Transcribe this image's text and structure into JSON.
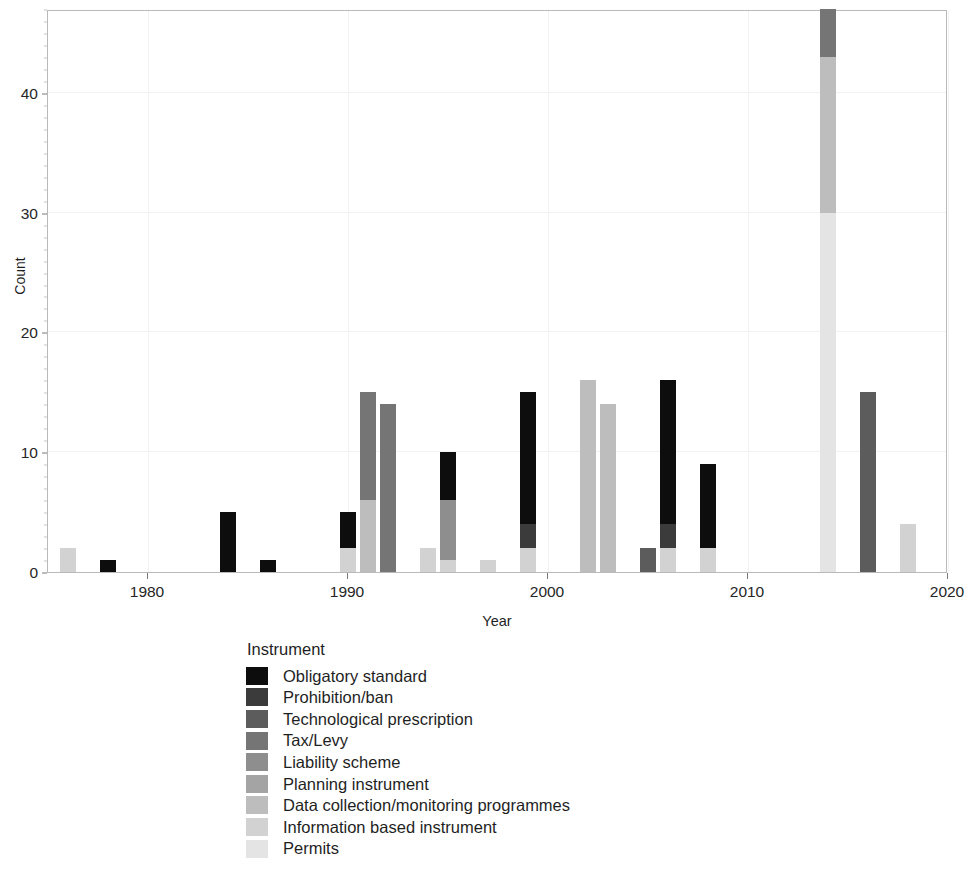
{
  "chart_data": {
    "type": "bar",
    "stacked": true,
    "title": "",
    "xlabel": "Year",
    "ylabel": "Count",
    "xlim": [
      1975,
      2020
    ],
    "ylim": [
      0,
      47
    ],
    "xticks": [
      1980,
      1990,
      2000,
      2010,
      2020
    ],
    "xtick_labels": [
      "1980",
      "1990",
      "2000",
      "2010",
      "2020"
    ],
    "yticks": [
      0,
      10,
      20,
      30,
      40
    ],
    "ytick_labels": [
      "0",
      "10",
      "20",
      "30",
      "40"
    ],
    "grid": true,
    "legend_title": "Instrument",
    "legend_position": "bottom-left",
    "series": [
      {
        "name": "Obligatory standard",
        "color": "#0d0d0d"
      },
      {
        "name": "Prohibition/ban",
        "color": "#3b3b3b"
      },
      {
        "name": "Technological prescription",
        "color": "#5c5c5c"
      },
      {
        "name": "Tax/Levy",
        "color": "#757575"
      },
      {
        "name": "Liability scheme",
        "color": "#8e8e8e"
      },
      {
        "name": "Planning instrument",
        "color": "#a4a4a4"
      },
      {
        "name": "Data collection/monitoring programmes",
        "color": "#bdbdbd"
      },
      {
        "name": "Information based instrument",
        "color": "#d2d2d2"
      },
      {
        "name": "Permits",
        "color": "#e4e4e4"
      }
    ],
    "bars": [
      {
        "year": 1976,
        "total": 2,
        "segments": [
          {
            "series": "Information based instrument",
            "value": 2
          }
        ]
      },
      {
        "year": 1978,
        "total": 1,
        "segments": [
          {
            "series": "Obligatory standard",
            "value": 1
          }
        ]
      },
      {
        "year": 1984,
        "total": 5,
        "segments": [
          {
            "series": "Obligatory standard",
            "value": 5
          }
        ]
      },
      {
        "year": 1986,
        "total": 1,
        "segments": [
          {
            "series": "Obligatory standard",
            "value": 1
          }
        ]
      },
      {
        "year": 1990,
        "total": 5,
        "segments": [
          {
            "series": "Information based instrument",
            "value": 2
          },
          {
            "series": "Obligatory standard",
            "value": 3
          }
        ]
      },
      {
        "year": 1991,
        "total": 15,
        "segments": [
          {
            "series": "Data collection/monitoring programmes",
            "value": 6
          },
          {
            "series": "Tax/Levy",
            "value": 9
          }
        ]
      },
      {
        "year": 1992,
        "total": 14,
        "segments": [
          {
            "series": "Tax/Levy",
            "value": 14
          }
        ]
      },
      {
        "year": 1994,
        "total": 2,
        "segments": [
          {
            "series": "Information based instrument",
            "value": 2
          }
        ]
      },
      {
        "year": 1995,
        "total": 10,
        "segments": [
          {
            "series": "Information based instrument",
            "value": 1
          },
          {
            "series": "Liability scheme",
            "value": 5
          },
          {
            "series": "Obligatory standard",
            "value": 4
          }
        ]
      },
      {
        "year": 1997,
        "total": 1,
        "segments": [
          {
            "series": "Information based instrument",
            "value": 1
          }
        ]
      },
      {
        "year": 1999,
        "total": 15,
        "segments": [
          {
            "series": "Information based instrument",
            "value": 2
          },
          {
            "series": "Prohibition/ban",
            "value": 2
          },
          {
            "series": "Obligatory standard",
            "value": 11
          }
        ]
      },
      {
        "year": 2002,
        "total": 16,
        "segments": [
          {
            "series": "Data collection/monitoring programmes",
            "value": 16
          }
        ]
      },
      {
        "year": 2003,
        "total": 14,
        "segments": [
          {
            "series": "Data collection/monitoring programmes",
            "value": 14
          }
        ]
      },
      {
        "year": 2005,
        "total": 2,
        "segments": [
          {
            "series": "Technological prescription",
            "value": 2
          }
        ]
      },
      {
        "year": 2006,
        "total": 16,
        "segments": [
          {
            "series": "Information based instrument",
            "value": 2
          },
          {
            "series": "Prohibition/ban",
            "value": 2
          },
          {
            "series": "Obligatory standard",
            "value": 12
          }
        ]
      },
      {
        "year": 2008,
        "total": 9,
        "segments": [
          {
            "series": "Information based instrument",
            "value": 2
          },
          {
            "series": "Obligatory standard",
            "value": 7
          }
        ]
      },
      {
        "year": 2014,
        "total": 47,
        "segments": [
          {
            "series": "Permits",
            "value": 30
          },
          {
            "series": "Data collection/monitoring programmes",
            "value": 13
          },
          {
            "series": "Tax/Levy",
            "value": 4
          }
        ]
      },
      {
        "year": 2016,
        "total": 15,
        "segments": [
          {
            "series": "Technological prescription",
            "value": 15
          }
        ]
      },
      {
        "year": 2018,
        "total": 4,
        "segments": [
          {
            "series": "Information based instrument",
            "value": 4
          }
        ]
      }
    ]
  }
}
